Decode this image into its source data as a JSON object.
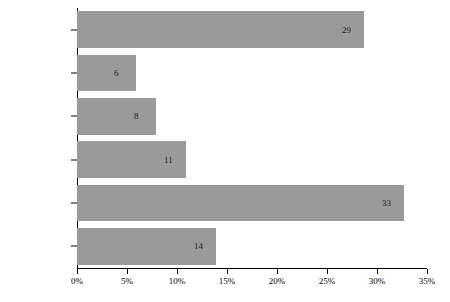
{
  "chart_data": {
    "type": "bar",
    "orientation": "horizontal",
    "title": "",
    "subtitle": "",
    "xlabel": "",
    "ylabel": "",
    "categories": [
      "It's just me",
      "1–5",
      "6–10",
      "11–15",
      "16–20",
      "20+"
    ],
    "values": [
      13.9,
      32.7,
      10.9,
      7.9,
      5.9,
      28.7
    ],
    "counts": [
      14,
      33,
      11,
      8,
      6,
      29
    ],
    "data_labels": [
      "14",
      "33",
      "11",
      "8",
      "6",
      "29"
    ],
    "total_responses": 101,
    "xlim": [
      0,
      35
    ],
    "xticks": [
      0,
      5,
      10,
      15,
      20,
      25,
      30,
      35
    ],
    "xtick_labels": [
      "0%",
      "5%",
      "10%",
      "15%",
      "20%",
      "25%",
      "30%",
      "35%"
    ],
    "grid": false,
    "legend": null,
    "bar_color": "#9a9a9a",
    "axis_color": "#000000",
    "label_color": "#1a1a1a",
    "value_unit": "%"
  }
}
